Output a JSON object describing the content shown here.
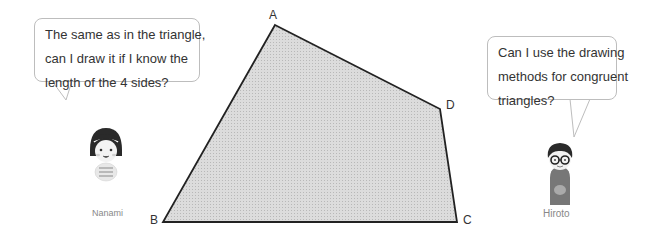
{
  "diagram": {
    "shape": "quadrilateral",
    "vertices": [
      {
        "label": "A",
        "x": 275,
        "y": 25
      },
      {
        "label": "D",
        "x": 440,
        "y": 109
      },
      {
        "label": "C",
        "x": 457,
        "y": 222
      },
      {
        "label": "B",
        "x": 163,
        "y": 222
      }
    ],
    "fill_color": "#d4d4d4",
    "stroke_color": "#222222"
  },
  "characters": [
    {
      "name": "Nanami",
      "speech": [
        "The same as in the triangle,",
        "can I draw it if I know the",
        "length of the 4 sides?"
      ]
    },
    {
      "name": "Hiroto",
      "speech": [
        "Can I use the drawing",
        "methods for congruent",
        "triangles?"
      ]
    }
  ]
}
